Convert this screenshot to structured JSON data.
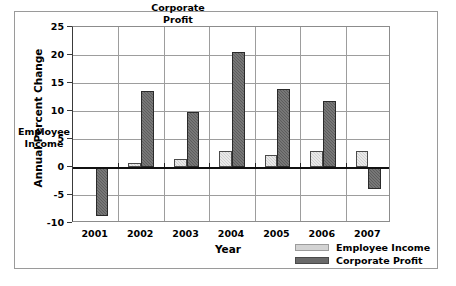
{
  "chart_data": {
    "type": "bar",
    "title": "",
    "xlabel": "Year",
    "ylabel": "Annual Percent Change",
    "categories": [
      "2001",
      "2002",
      "2003",
      "2004",
      "2005",
      "2006",
      "2007"
    ],
    "series": [
      {
        "name": "Employee Income",
        "color": "#d3d3d3",
        "values": [
          0.0,
          0.7,
          1.5,
          2.9,
          2.2,
          2.8,
          2.8
        ]
      },
      {
        "name": "Corporate Profit",
        "color": "#6a6a6a",
        "values": [
          -8.7,
          13.6,
          9.8,
          20.6,
          13.9,
          11.8,
          -4.0
        ]
      }
    ],
    "ylim": [
      -10,
      25
    ],
    "yticks": [
      25,
      20,
      15,
      10,
      5,
      0,
      -5,
      -10
    ],
    "ytick_labels": [
      "25",
      "20",
      "15",
      "10",
      "5",
      "0",
      "-5",
      "-10"
    ],
    "grid": "horizontal-and-vertical",
    "legend_position": "bottom-right",
    "annotations": [
      {
        "text": "Employee\nIncome",
        "target": "2001-employee-income"
      },
      {
        "text": "Corporate\nProfit",
        "target": "2004-corporate-profit"
      }
    ]
  },
  "legend": {
    "items": [
      {
        "label": "Employee Income",
        "swatch": "light"
      },
      {
        "label": "Corporate Profit",
        "swatch": "dark"
      }
    ]
  },
  "axis": {
    "y_title": "Annual Percent Change",
    "x_title": "Year"
  }
}
